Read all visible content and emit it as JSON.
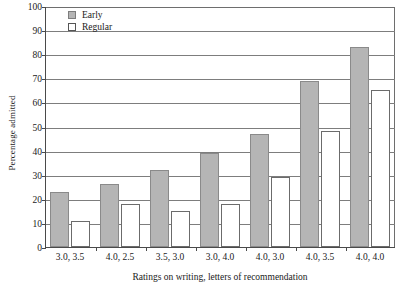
{
  "chart_data": {
    "type": "bar",
    "title": "",
    "xlabel": "Ratings on writing, letters of recommendation",
    "ylabel": "Percentage admitted",
    "ylim": [
      0,
      100
    ],
    "ytick_step": 10,
    "yticks": [
      0,
      10,
      20,
      30,
      40,
      50,
      60,
      70,
      80,
      90,
      100
    ],
    "grid": true,
    "legend_position": "top-left-inside",
    "categories": [
      "3.0, 3.5",
      "4.0, 2.5",
      "3.5, 3.0",
      "3.0, 4.0",
      "4.0, 3.0",
      "4.0, 3.5",
      "4.0, 4.0"
    ],
    "series": [
      {
        "name": "Early",
        "color": "#b5b5b5",
        "values": [
          23,
          26,
          32,
          39,
          47,
          69,
          83
        ]
      },
      {
        "name": "Regular",
        "color": "#ffffff",
        "values": [
          11,
          18,
          15,
          18,
          29,
          48,
          65
        ]
      }
    ]
  },
  "legend": {
    "items": [
      {
        "label": "Early"
      },
      {
        "label": "Regular"
      }
    ]
  }
}
